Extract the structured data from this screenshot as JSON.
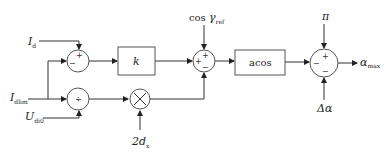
{
  "diagram": {
    "inputs": {
      "id": {
        "main": "I",
        "sub": "d"
      },
      "idlim": {
        "main": "I",
        "sub": "dlim"
      },
      "udi0": {
        "main": "U",
        "sub": "di0"
      },
      "two_dx": {
        "main": "2d",
        "sub": "x"
      },
      "cos_gamma_ref": {
        "prefix": "cos ",
        "main": "γ",
        "sub": "ref"
      },
      "pi": "π",
      "delta_alpha": "Δα"
    },
    "blocks": {
      "gain": "k",
      "acos": "acos"
    },
    "output": {
      "main": "α",
      "sub": "max"
    },
    "signs": {
      "sum1_top": "+",
      "sum1_left": "−",
      "div": "÷",
      "mult": "×",
      "sum2_top": "+",
      "sum2_left": "+",
      "sum2_bottom": "−",
      "sum3_top": "+",
      "sum3_left": "−",
      "sum3_bottom": "−"
    }
  }
}
